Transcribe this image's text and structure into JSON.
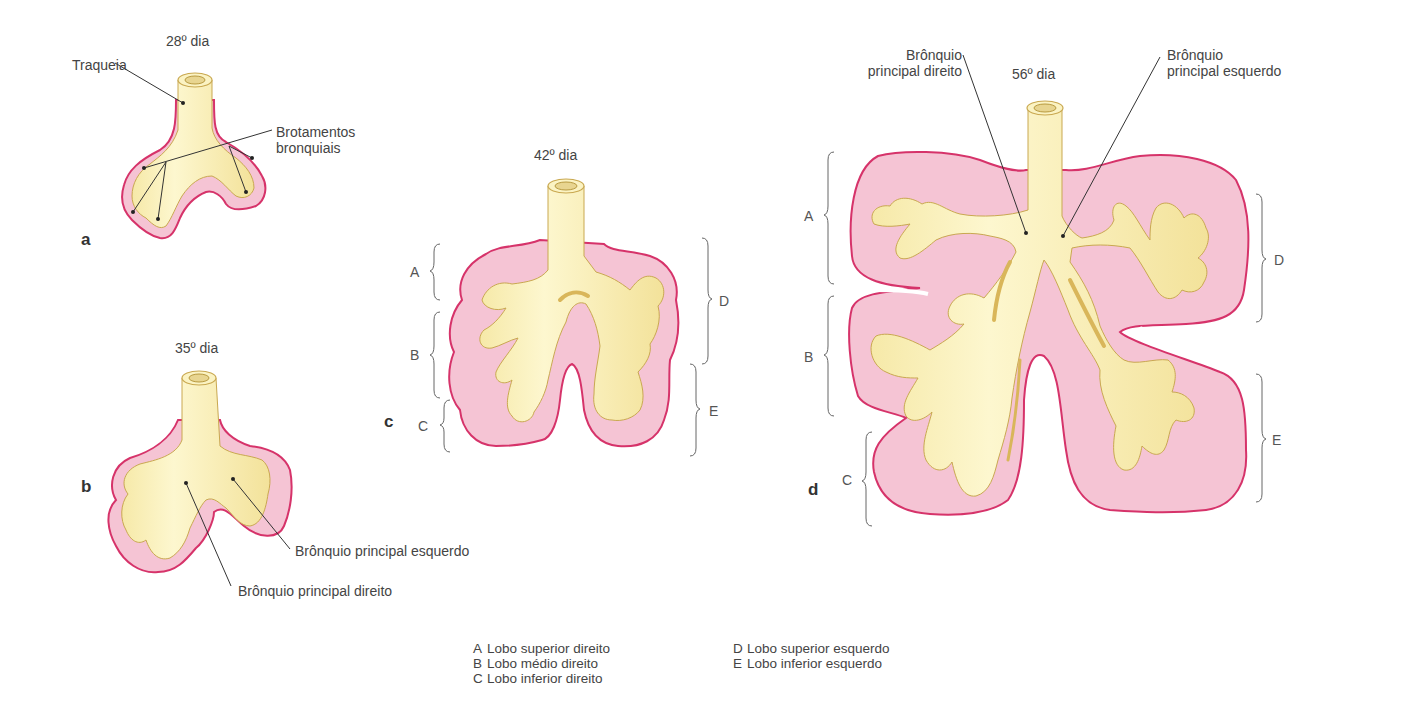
{
  "colors": {
    "airway_fill": "#fbf3c3",
    "airway_shadow": "#d9b65a",
    "mesenchyme_fill": "#f5c4d4",
    "mesenchyme_border": "#d6336a",
    "leader_line": "#333333",
    "bracket": "#666666"
  },
  "panels": {
    "a": {
      "letter": "a",
      "day_label": "28º dia",
      "labels": {
        "trachea": "Traqueia",
        "buds_line1": "Brotamentos",
        "buds_line2": "bronquiais"
      }
    },
    "b": {
      "letter": "b",
      "day_label": "35º dia",
      "labels": {
        "left_main_bronchus": "Brônquio principal esquerdo",
        "right_main_bronchus": "Brônquio principal direito"
      }
    },
    "c": {
      "letter": "c",
      "day_label": "42º dia",
      "lobe_brackets": [
        "A",
        "B",
        "C",
        "D",
        "E"
      ]
    },
    "d": {
      "letter": "d",
      "day_label": "56º dia",
      "labels": {
        "right_line1": "Brônquio",
        "right_line2": "principal direito",
        "left_line1": "Brônquio",
        "left_line2": "principal esquerdo"
      },
      "lobe_brackets": [
        "A",
        "B",
        "C",
        "D",
        "E"
      ]
    }
  },
  "legend": {
    "left": [
      {
        "key": "A",
        "text": "Lobo superior direito"
      },
      {
        "key": "B",
        "text": "Lobo médio direito"
      },
      {
        "key": "C",
        "text": "Lobo inferior direito"
      }
    ],
    "right": [
      {
        "key": "D",
        "text": "Lobo superior esquerdo"
      },
      {
        "key": "E",
        "text": "Lobo inferior esquerdo"
      }
    ]
  }
}
